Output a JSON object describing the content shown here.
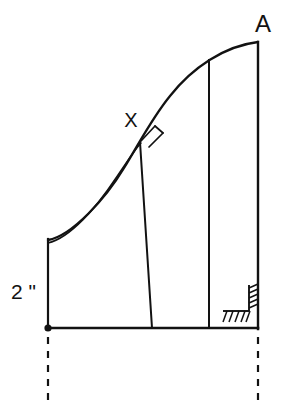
{
  "diagram": {
    "background_color": "#ffffff",
    "stroke_color": "#121212",
    "shade_color": "#d9d9d9",
    "labels": {
      "apex_point": "A",
      "curve_point": "X",
      "height_dimension": "2 \""
    },
    "geometry": {
      "origin_point": [
        48,
        328
      ],
      "baseline_start": [
        48,
        328
      ],
      "baseline_end": [
        258,
        328
      ],
      "left_vertical_top": [
        48,
        240
      ],
      "left_vertical_bottom": [
        48,
        328
      ],
      "right_vertical_top": [
        258,
        42
      ],
      "right_vertical_bottom": [
        258,
        328
      ],
      "curve_start": [
        48,
        240
      ],
      "curve_apex": [
        258,
        42
      ],
      "point_x_on_curve": [
        140,
        143
      ],
      "slanted_line_bottom": [
        152,
        328
      ],
      "inner_vertical_top": [
        209,
        60
      ],
      "inner_vertical_bottom": [
        209,
        328
      ],
      "dashed_left_from": [
        48,
        336
      ],
      "dashed_left_to": [
        48,
        404
      ],
      "dashed_right_from": [
        258,
        336
      ],
      "dashed_right_to": [
        258,
        404
      ]
    },
    "annotations": {
      "right_angle_at_x": "perpendicular-square-mark",
      "corner_hatch": "hatched-right-angle-corner",
      "origin_marker": "filled-dot"
    }
  }
}
